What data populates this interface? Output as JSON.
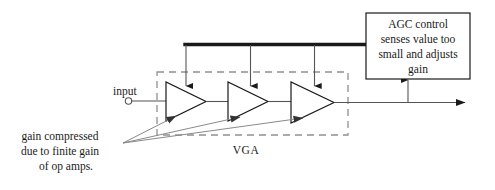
{
  "diagram": {
    "title_block": {
      "lines": [
        "AGC control",
        "senses value too",
        "small and adjusts",
        "gain"
      ],
      "name": "agc-control-box"
    },
    "input_label": "input",
    "vga_label": "VGA",
    "annotation": {
      "lines": [
        "gain compressed",
        "due to finite gain",
        "of op amps."
      ]
    },
    "amplifiers": [
      {
        "label": "",
        "index": 1
      },
      {
        "label": "",
        "index": 2
      },
      {
        "label": "",
        "index": 3
      }
    ],
    "colors": {
      "stroke": "#1a1a1a",
      "thin_line": "#555555",
      "annotation_line": "#8a8a8a",
      "dashed_box": "#8a8a8a",
      "background": "#ffffff"
    }
  }
}
